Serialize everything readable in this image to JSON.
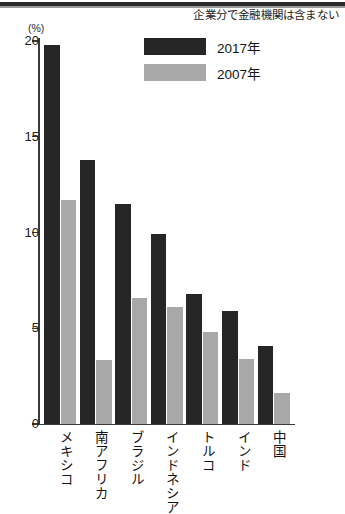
{
  "note": "企業分で金融機関は含まない",
  "unit_label": "(%)",
  "legend": {
    "entries": [
      {
        "label": "2017年",
        "color": "#262626",
        "swatch_name": "legend-swatch-2017"
      },
      {
        "label": "2007年",
        "color": "#a8a8a8",
        "swatch_name": "legend-swatch-2007"
      }
    ]
  },
  "chart_data": {
    "type": "bar",
    "title": "",
    "subtitle": "",
    "xlabel": "",
    "ylabel": "(%)",
    "ylim": [
      0,
      20
    ],
    "yticks": [
      "0",
      "5",
      "10",
      "15",
      "20"
    ],
    "ytick_values": [
      0,
      5,
      10,
      15,
      20
    ],
    "grid": false,
    "legend_position": "top-center",
    "annotations": [
      "企業分で金融機関は含まない"
    ],
    "categories": [
      "メキシコ",
      "南アフリカ",
      "ブラジル",
      "インドネシア",
      "トルコ",
      "インド",
      "中国"
    ],
    "series": [
      {
        "name": "2017年",
        "color": "#262626",
        "values": [
          19.8,
          13.8,
          11.5,
          9.9,
          6.8,
          5.9,
          4.1
        ]
      },
      {
        "name": "2007年",
        "color": "#a8a8a8",
        "values": [
          11.7,
          3.35,
          6.6,
          6.1,
          4.8,
          3.4,
          1.6
        ]
      }
    ]
  }
}
